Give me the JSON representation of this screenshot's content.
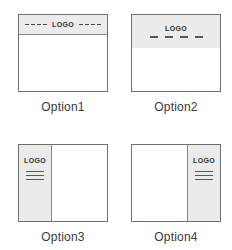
{
  "sheet": {
    "title": "Logo placement layout options",
    "colors": {
      "band_fill": "#EBEBEB",
      "box_border": "#6F6F6F",
      "divider": "#8A8A8A",
      "content_fill": "#FFFFFF",
      "text": "#333333",
      "caption_text": "#3A3A3A"
    }
  },
  "options": [
    {
      "id": "option1",
      "caption": "Option1",
      "layout": "top-bar-centered-logo",
      "logo_label": "LOGO",
      "header_band": true,
      "dashes_left": 4,
      "dashes_right": 4,
      "nav_dashes": 0,
      "sidebar": "none"
    },
    {
      "id": "option2",
      "caption": "Option2",
      "layout": "top-bar-stacked-logo-above-nav",
      "logo_label": "LOGO",
      "header_band": true,
      "dashes_left": 0,
      "dashes_right": 0,
      "nav_dashes": 4,
      "sidebar": "none"
    },
    {
      "id": "option3",
      "caption": "Option3",
      "layout": "left-sidebar-logo",
      "logo_label": "LOGO",
      "header_band": false,
      "dashes_left": 0,
      "dashes_right": 0,
      "nav_dashes": 0,
      "sidebar": "left",
      "menu_lines": 3
    },
    {
      "id": "option4",
      "caption": "Option4",
      "layout": "right-sidebar-logo",
      "logo_label": "LOGO",
      "header_band": false,
      "dashes_left": 0,
      "dashes_right": 0,
      "nav_dashes": 0,
      "sidebar": "right",
      "menu_lines": 3
    }
  ]
}
